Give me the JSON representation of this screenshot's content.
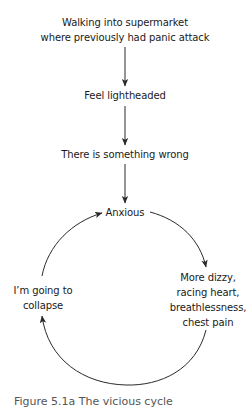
{
  "diagram": {
    "title_node": {
      "line1": "Walking into supermarket",
      "line2": "where previously had panic attack"
    },
    "nodes": {
      "feel_lightheaded": "Feel lightheaded",
      "something_wrong": "There is something wrong",
      "anxious": "Anxious",
      "symptoms": {
        "line1": "More dizzy,",
        "line2": "racing heart,",
        "line3": "breathlessness,",
        "line4": "chest pain"
      },
      "collapse": {
        "line1": "I’m going to",
        "line2": "collapse"
      }
    },
    "edges": [
      {
        "from": "Walking into supermarket where previously had panic attack",
        "to": "Feel lightheaded",
        "type": "straight-arrow"
      },
      {
        "from": "Feel lightheaded",
        "to": "There is something wrong",
        "type": "straight-arrow"
      },
      {
        "from": "There is something wrong",
        "to": "Anxious",
        "type": "straight-arrow"
      },
      {
        "from": "Anxious",
        "to": "More dizzy, racing heart, breathlessness, chest pain",
        "type": "curved-arrow"
      },
      {
        "from": "More dizzy, racing heart, breathlessness, chest pain",
        "to": "I’m going to collapse",
        "type": "curved-arrow"
      },
      {
        "from": "I’m going to collapse",
        "to": "Anxious",
        "type": "curved-arrow"
      }
    ],
    "caption": "Figure 5.1a  The vicious cycle"
  },
  "colors": {
    "line": "#2a2a2a",
    "text": "#1a1a1a",
    "background": "#ffffff"
  }
}
